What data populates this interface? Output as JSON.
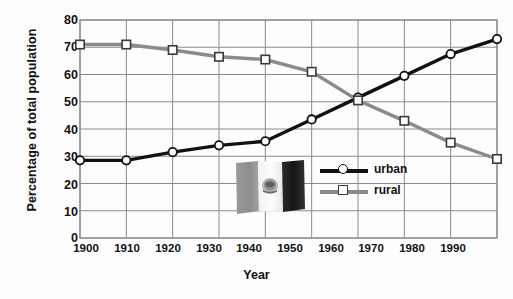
{
  "chart_data": {
    "type": "line",
    "title": "",
    "xlabel": "Year",
    "ylabel": "Percentage of total population",
    "x": [
      1900,
      1910,
      1920,
      1930,
      1940,
      1950,
      1960,
      1970,
      1980,
      1990
    ],
    "xticklabels": [
      "1900",
      "1910",
      "1920",
      "1930",
      "1940",
      "1950",
      "1960",
      "1970",
      "1980",
      "1990"
    ],
    "yticklabels": [
      "80",
      "70",
      "60",
      "50",
      "40",
      "30",
      "20",
      "10",
      "0"
    ],
    "yticks": [
      80,
      70,
      60,
      50,
      40,
      30,
      20,
      10,
      0
    ],
    "xlim": [
      1900,
      1990
    ],
    "ylim": [
      0,
      80
    ],
    "grid": true,
    "legend_position": "center-right-inside",
    "series": [
      {
        "name": "urban",
        "marker": "circle",
        "color": "#111111",
        "values": [
          28.5,
          28.5,
          31.5,
          34.0,
          35.5,
          43.5,
          51.5,
          59.5,
          67.5,
          73.0
        ]
      },
      {
        "name": "rural",
        "marker": "square",
        "color": "#8b8b8b",
        "values": [
          71.0,
          71.0,
          69.0,
          66.5,
          65.5,
          61.0,
          50.5,
          43.0,
          35.0,
          29.0
        ]
      }
    ],
    "annotations": [
      {
        "name": "mexican-flag",
        "type": "image",
        "description": "Mexican flag (grayscale)"
      }
    ]
  },
  "legend": {
    "items": [
      {
        "label": "urban",
        "marker": "circle-marker-icon",
        "color": "#111111"
      },
      {
        "label": "rural",
        "marker": "square-marker-icon",
        "color": "#8b8b8b"
      }
    ]
  },
  "axes": {
    "x_title": "Year",
    "y_title": "Percentage of total population"
  },
  "colors": {
    "urban_line": "#111111",
    "rural_line": "#8b8b8b",
    "grid": "#8a8a8a",
    "text": "#111111",
    "background": "#fdfdfd"
  }
}
